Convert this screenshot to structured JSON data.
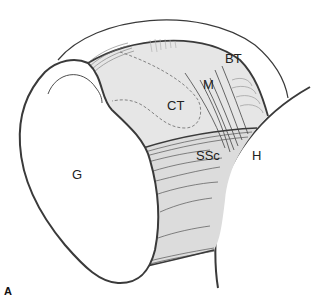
{
  "figure": {
    "panel_label": "A",
    "labels": {
      "glenoid": "G",
      "coracohumeral_tissue": "CT",
      "medial_fibers": "M",
      "biceps_tendon": "BT",
      "subscapularis": "SSc",
      "humerus": "H"
    },
    "colors": {
      "outline": "#3a3a3a",
      "fill_light": "#e6e6e6",
      "fill_band": "#d4d4d4",
      "background": "#ffffff"
    }
  }
}
